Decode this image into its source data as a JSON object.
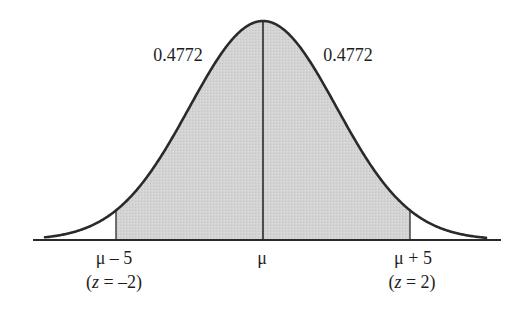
{
  "diagram": {
    "type": "normal-distribution",
    "colors": {
      "curve": "#2a2a2a",
      "shade": "#d3d3d3",
      "axis": "#2a2a2a",
      "text": "#1e1e1e"
    },
    "geometry": {
      "mean_x": 263,
      "baseline_y": 240,
      "peak_y": 21,
      "sigma_px": 73.5,
      "curve_x_start": 45,
      "curve_x_end": 486,
      "axis_x_start": 33,
      "axis_x_end": 501,
      "shade_z_from": -2,
      "shade_z_to": 2
    },
    "area_labels": {
      "left": "0.4772",
      "right": "0.4772"
    },
    "axis_labels": {
      "left_value": "μ – 5",
      "left_z_open": "(",
      "left_z_var": "z",
      "left_z_rest": " = –2)",
      "center_value": "μ",
      "right_value": "μ + 5",
      "right_z_open": "(",
      "right_z_var": "z",
      "right_z_rest": " = 2)"
    }
  }
}
